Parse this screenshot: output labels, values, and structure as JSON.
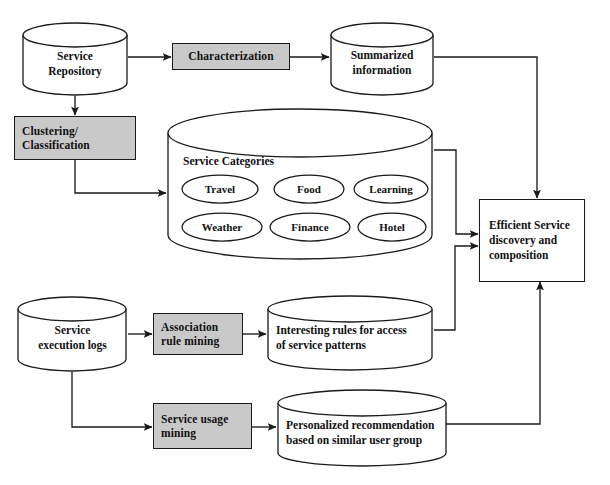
{
  "diagram": {
    "style": {
      "process_fill": "#c9c9c9",
      "node_stroke": "#1a1a1a",
      "background": "#ffffff",
      "edge_color": "#1a1a1a"
    },
    "nodes": {
      "service_repository": {
        "label_lines": [
          "Service",
          "Repository"
        ],
        "shape": "cylinder"
      },
      "characterization": {
        "label": "Characterization",
        "shape": "process"
      },
      "summarized_information": {
        "label_lines": [
          "Summarized",
          "information"
        ],
        "shape": "cylinder"
      },
      "clustering_classification": {
        "label_lines": [
          "Clustering/",
          "Classification"
        ],
        "shape": "process"
      },
      "service_categories": {
        "title": "Service Categories",
        "shape": "cylinder"
      },
      "efficient_service": {
        "label_lines": [
          "Efficient Service",
          "discovery and",
          "composition"
        ],
        "shape": "rectangle"
      },
      "service_execution_logs": {
        "label_lines": [
          "Service",
          "execution logs"
        ],
        "shape": "cylinder"
      },
      "association_rule_mining": {
        "label_lines": [
          "Association",
          "rule mining"
        ],
        "shape": "process"
      },
      "interesting_rules": {
        "label_lines": [
          "Interesting rules for access",
          "of service patterns"
        ],
        "shape": "cylinder"
      },
      "service_usage_mining": {
        "label_lines": [
          "Service usage",
          "mining"
        ],
        "shape": "process"
      },
      "personalized_recommendation": {
        "label_lines": [
          "Personalized recommendation",
          "based on similar user group"
        ],
        "shape": "cylinder"
      }
    },
    "categories": [
      {
        "label": "Travel"
      },
      {
        "label": "Food"
      },
      {
        "label": "Learning"
      },
      {
        "label": "Weather"
      },
      {
        "label": "Finance"
      },
      {
        "label": "Hotel"
      }
    ],
    "edges": [
      {
        "from": "service_repository",
        "to": "characterization"
      },
      {
        "from": "characterization",
        "to": "summarized_information"
      },
      {
        "from": "service_repository",
        "to": "clustering_classification"
      },
      {
        "from": "clustering_classification",
        "to": "service_categories"
      },
      {
        "from": "summarized_information",
        "to": "efficient_service"
      },
      {
        "from": "service_categories",
        "to": "efficient_service"
      },
      {
        "from": "service_execution_logs",
        "to": "association_rule_mining"
      },
      {
        "from": "association_rule_mining",
        "to": "interesting_rules"
      },
      {
        "from": "interesting_rules",
        "to": "efficient_service"
      },
      {
        "from": "service_execution_logs",
        "to": "service_usage_mining"
      },
      {
        "from": "service_usage_mining",
        "to": "personalized_recommendation"
      },
      {
        "from": "personalized_recommendation",
        "to": "efficient_service"
      }
    ]
  }
}
